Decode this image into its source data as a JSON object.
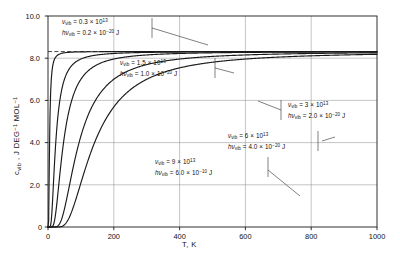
{
  "chart_data": {
    "type": "line",
    "title": "",
    "xlabel": "T, K",
    "ylabel": "c_vib, J DEG⁻¹ MOL⁻¹",
    "xlim": [
      0,
      1000
    ],
    "ylim": [
      0,
      10.0
    ],
    "xticks": [
      0,
      200,
      400,
      600,
      800,
      1000
    ],
    "xtick_labels": [
      "0",
      "200",
      "400",
      "600",
      "800",
      "1000"
    ],
    "yticks": [
      0,
      2.0,
      4.0,
      6.0,
      8.0,
      10.0
    ],
    "ytick_labels": [
      "0",
      "2.0",
      "4.0",
      "6.0",
      "8.0",
      "10.0"
    ],
    "grid": "major-xy",
    "legend_position": "inline-annotations",
    "reference_line": {
      "value": 8.314,
      "style": "dashed",
      "label": ""
    },
    "series": [
      {
        "name": "nu_vib = 0.3 x 10^13",
        "theta_K": 14.5,
        "x": [
          0,
          10,
          20,
          30,
          40,
          50,
          60,
          80,
          100,
          150,
          200,
          300,
          400,
          600,
          800,
          1000
        ],
        "y": [
          0.0,
          2.36,
          6.29,
          7.53,
          7.94,
          8.11,
          8.19,
          8.26,
          8.29,
          8.31,
          8.31,
          8.31,
          8.31,
          8.31,
          8.31,
          8.31
        ]
      },
      {
        "name": "nu_vib = 1.5 x 10^13",
        "theta_K": 72.4,
        "x": [
          0,
          20,
          40,
          60,
          80,
          100,
          120,
          150,
          200,
          250,
          300,
          400,
          500,
          600,
          800,
          1000
        ],
        "y": [
          0.0,
          0.42,
          2.59,
          4.66,
          5.99,
          6.79,
          7.25,
          7.65,
          7.94,
          8.07,
          8.15,
          8.22,
          8.25,
          8.27,
          8.29,
          8.3
        ]
      },
      {
        "name": "nu_vib = 3 x 10^13",
        "theta_K": 144.9,
        "x": [
          0,
          40,
          60,
          80,
          100,
          140,
          180,
          220,
          260,
          300,
          400,
          500,
          600,
          700,
          800,
          900,
          1000
        ],
        "y": [
          0.0,
          0.42,
          1.18,
          2.11,
          2.99,
          4.46,
          5.49,
          6.21,
          6.7,
          7.05,
          7.58,
          7.84,
          7.98,
          8.07,
          8.13,
          8.17,
          8.2
        ]
      },
      {
        "name": "nu_vib = 6 x 10^13",
        "theta_K": 289.8,
        "x": [
          0,
          60,
          100,
          140,
          180,
          220,
          260,
          300,
          360,
          420,
          500,
          600,
          700,
          800,
          900,
          1000
        ],
        "y": [
          0.0,
          0.06,
          0.42,
          1.05,
          1.78,
          2.5,
          3.16,
          3.74,
          4.47,
          5.05,
          5.66,
          6.23,
          6.62,
          6.91,
          7.13,
          7.29
        ]
      },
      {
        "name": "nu_vib = 9 x 10^13",
        "theta_K": 434.7,
        "x": [
          0,
          100,
          150,
          200,
          250,
          300,
          350,
          400,
          500,
          600,
          700,
          800,
          900,
          1000
        ],
        "y": [
          0.0,
          0.1,
          0.38,
          0.82,
          1.34,
          1.88,
          2.41,
          2.91,
          3.79,
          4.5,
          5.07,
          5.52,
          5.88,
          6.17
        ]
      }
    ],
    "annotations": [
      {
        "id": "ann-1",
        "nu_label": "ν",
        "nu_sub": "vib",
        "nu_value": "= 0.3 × 10",
        "nu_exp": "13",
        "h_label": "hν",
        "h_sub": "vib",
        "h_value": "= 0.2 × 10",
        "h_exp": "−20",
        "h_unit": "J"
      },
      {
        "id": "ann-2",
        "nu_label": "ν",
        "nu_sub": "vib",
        "nu_value": "= 1.5 × 10",
        "nu_exp": "13",
        "h_label": "hν",
        "h_sub": "vib",
        "h_value": "= 1.0 × 10",
        "h_exp": "−20",
        "h_unit": "J"
      },
      {
        "id": "ann-3",
        "nu_label": "ν",
        "nu_sub": "vib",
        "nu_value": "= 3 × 10",
        "nu_exp": "13",
        "h_label": "hν",
        "h_sub": "vib",
        "h_value": "= 2.0 × 10",
        "h_exp": "−20",
        "h_unit": "J"
      },
      {
        "id": "ann-4",
        "nu_label": "ν",
        "nu_sub": "vib",
        "nu_value": "= 6 × 10",
        "nu_exp": "13",
        "h_label": "hν",
        "h_sub": "vib",
        "h_value": "= 4.0 × 10",
        "h_exp": "−20",
        "h_unit": "J"
      },
      {
        "id": "ann-5",
        "nu_label": "ν",
        "nu_sub": "vib",
        "nu_value": "= 9 × 10",
        "nu_exp": "13",
        "h_label": "hν",
        "h_sub": "vib",
        "h_value": "= 6.0 × 10",
        "h_exp": "−10",
        "h_unit": "J"
      }
    ],
    "colors": {
      "curve": "#1a1a1a",
      "grid": "#8a8a8a",
      "frame": "#1a1a1a",
      "background": "#ffffff",
      "text": "#111111",
      "leader": "#4a4a4a"
    }
  }
}
